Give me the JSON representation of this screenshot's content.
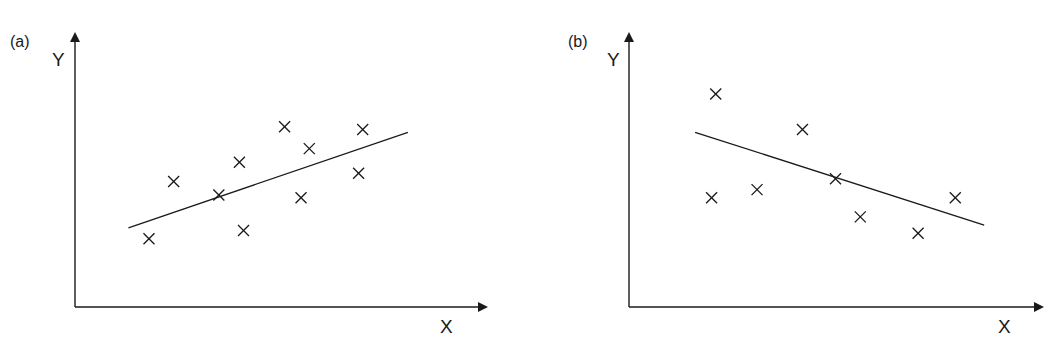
{
  "figure": {
    "panels": [
      {
        "id": "a",
        "panel_label": "(a)",
        "x_axis_label": "X",
        "y_axis_label": "Y",
        "trend": "positive"
      },
      {
        "id": "b",
        "panel_label": "(b)",
        "x_axis_label": "X",
        "y_axis_label": "Y",
        "trend": "negative"
      }
    ]
  },
  "chart_data": [
    {
      "type": "scatter",
      "title": "(a)",
      "xlabel": "X",
      "ylabel": "Y",
      "grid": false,
      "legend": null,
      "marker": "x",
      "axis_ticks": "none",
      "xlim": [
        0,
        100
      ],
      "ylim": [
        0,
        100
      ],
      "points": [
        {
          "x": 18,
          "y": 25
        },
        {
          "x": 24,
          "y": 46
        },
        {
          "x": 35,
          "y": 41
        },
        {
          "x": 40,
          "y": 53
        },
        {
          "x": 41,
          "y": 28
        },
        {
          "x": 51,
          "y": 66
        },
        {
          "x": 55,
          "y": 40
        },
        {
          "x": 57,
          "y": 58
        },
        {
          "x": 69,
          "y": 49
        },
        {
          "x": 70,
          "y": 65
        }
      ],
      "fit_line": {
        "x": [
          13,
          81
        ],
        "y": [
          29,
          64
        ]
      },
      "annotation": "Regression line with positive slope"
    },
    {
      "type": "scatter",
      "title": "(b)",
      "xlabel": "X",
      "ylabel": "Y",
      "grid": false,
      "legend": null,
      "marker": "x",
      "axis_ticks": "none",
      "xlim": [
        0,
        100
      ],
      "ylim": [
        0,
        100
      ],
      "points": [
        {
          "x": 21,
          "y": 78
        },
        {
          "x": 20,
          "y": 40
        },
        {
          "x": 31,
          "y": 43
        },
        {
          "x": 42,
          "y": 65
        },
        {
          "x": 50,
          "y": 47
        },
        {
          "x": 56,
          "y": 33
        },
        {
          "x": 70,
          "y": 27
        },
        {
          "x": 79,
          "y": 40
        }
      ],
      "fit_line": {
        "x": [
          16,
          86
        ],
        "y": [
          64,
          30
        ]
      },
      "annotation": "Regression line with negative slope"
    }
  ]
}
